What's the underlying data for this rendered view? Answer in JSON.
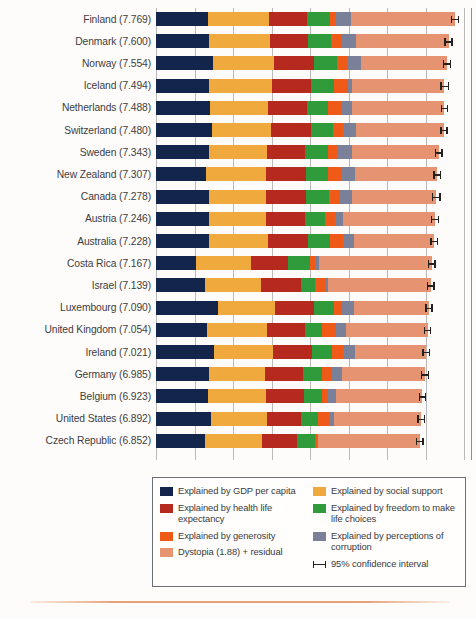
{
  "chart_data": {
    "type": "bar",
    "orientation": "horizontal",
    "stacked": true,
    "title": "",
    "xlabel": "",
    "ylabel": "",
    "xlim": [
      0,
      8
    ],
    "grid": true,
    "gridline_values": [
      0,
      1,
      2,
      3,
      4,
      5,
      6,
      7,
      8
    ],
    "legend_position": "bottom",
    "categories": [
      "Finland (7.769)",
      "Denmark (7.600)",
      "Norway (7.554)",
      "Iceland (7.494)",
      "Netherlands (7.488)",
      "Switzerland (7.480)",
      "Sweden (7.343)",
      "New Zealand (7.307)",
      "Canada (7.278)",
      "Austria (7.246)",
      "Australia (7.228)",
      "Costa Rica (7.167)",
      "Israel (7.139)",
      "Luxembourg (7.090)",
      "United Kingdom (7.054)",
      "Ireland (7.021)",
      "Germany (6.985)",
      "Belgium (6.923)",
      "United States (6.892)",
      "Czech Republic (6.852)"
    ],
    "series": [
      {
        "name": "Explained by GDP per capita",
        "key": "gdp",
        "color": "#14254c"
      },
      {
        "name": "Explained by social support",
        "key": "social",
        "color": "#f0a93c"
      },
      {
        "name": "Explained by health life expectancy",
        "key": "health",
        "color": "#b5291f"
      },
      {
        "name": "Explained by freedom to make life choices",
        "key": "freedom",
        "color": "#2f9b3a"
      },
      {
        "name": "Explained by generosity",
        "key": "generosity",
        "color": "#f05a19"
      },
      {
        "name": "Explained by perceptions of corruption",
        "key": "corruption",
        "color": "#7b8099"
      },
      {
        "name": "Dystopia (1.88) + residual",
        "key": "dystopia",
        "color": "#e59370"
      }
    ],
    "rows": [
      {
        "country": "Finland",
        "score": 7.769,
        "gdp": 1.34,
        "social": 1.587,
        "health": 0.986,
        "freedom": 0.596,
        "generosity": 0.153,
        "corruption": 0.393,
        "dystopia": 2.714,
        "ci_low": 7.66,
        "ci_high": 7.88
      },
      {
        "country": "Denmark",
        "score": 7.6,
        "gdp": 1.383,
        "social": 1.573,
        "health": 0.996,
        "freedom": 0.592,
        "generosity": 0.252,
        "corruption": 0.41,
        "dystopia": 2.394,
        "ci_low": 7.49,
        "ci_high": 7.71
      },
      {
        "country": "Norway",
        "score": 7.554,
        "gdp": 1.488,
        "social": 1.582,
        "health": 1.028,
        "freedom": 0.603,
        "generosity": 0.271,
        "corruption": 0.341,
        "dystopia": 2.241,
        "ci_low": 7.45,
        "ci_high": 7.66
      },
      {
        "country": "Iceland",
        "score": 7.494,
        "gdp": 1.38,
        "social": 1.624,
        "health": 1.026,
        "freedom": 0.591,
        "generosity": 0.354,
        "corruption": 0.118,
        "dystopia": 2.401,
        "ci_low": 7.38,
        "ci_high": 7.61
      },
      {
        "country": "Netherlands",
        "score": 7.488,
        "gdp": 1.396,
        "social": 1.522,
        "health": 0.999,
        "freedom": 0.557,
        "generosity": 0.322,
        "corruption": 0.298,
        "dystopia": 2.394,
        "ci_low": 7.39,
        "ci_high": 7.59
      },
      {
        "country": "Switzerland",
        "score": 7.48,
        "gdp": 1.452,
        "social": 1.526,
        "health": 1.052,
        "freedom": 0.572,
        "generosity": 0.263,
        "corruption": 0.343,
        "dystopia": 2.272,
        "ci_low": 7.38,
        "ci_high": 7.58
      },
      {
        "country": "Sweden",
        "score": 7.343,
        "gdp": 1.387,
        "social": 1.487,
        "health": 1.009,
        "freedom": 0.574,
        "generosity": 0.267,
        "corruption": 0.373,
        "dystopia": 2.246,
        "ci_low": 7.24,
        "ci_high": 7.45
      },
      {
        "country": "New Zealand",
        "score": 7.307,
        "gdp": 1.303,
        "social": 1.557,
        "health": 1.026,
        "freedom": 0.585,
        "generosity": 0.33,
        "corruption": 0.38,
        "dystopia": 2.126,
        "ci_low": 7.2,
        "ci_high": 7.41
      },
      {
        "country": "Canada",
        "score": 7.278,
        "gdp": 1.365,
        "social": 1.505,
        "health": 1.039,
        "freedom": 0.584,
        "generosity": 0.285,
        "corruption": 0.308,
        "dystopia": 2.192,
        "ci_low": 7.17,
        "ci_high": 7.39
      },
      {
        "country": "Austria",
        "score": 7.246,
        "gdp": 1.376,
        "social": 1.475,
        "health": 1.016,
        "freedom": 0.532,
        "generosity": 0.244,
        "corruption": 0.226,
        "dystopia": 2.377,
        "ci_low": 7.14,
        "ci_high": 7.35
      },
      {
        "country": "Australia",
        "score": 7.228,
        "gdp": 1.372,
        "social": 1.548,
        "health": 1.036,
        "freedom": 0.557,
        "generosity": 0.332,
        "corruption": 0.29,
        "dystopia": 2.093,
        "ci_low": 7.12,
        "ci_high": 7.33
      },
      {
        "country": "Costa Rica",
        "score": 7.167,
        "gdp": 1.034,
        "social": 1.441,
        "health": 0.963,
        "freedom": 0.558,
        "generosity": 0.144,
        "corruption": 0.093,
        "dystopia": 2.934,
        "ci_low": 7.06,
        "ci_high": 7.27
      },
      {
        "country": "Israel",
        "score": 7.139,
        "gdp": 1.276,
        "social": 1.455,
        "health": 1.029,
        "freedom": 0.371,
        "generosity": 0.261,
        "corruption": 0.082,
        "dystopia": 2.665,
        "ci_low": 7.04,
        "ci_high": 7.24
      },
      {
        "country": "Luxembourg",
        "score": 7.09,
        "gdp": 1.609,
        "social": 1.479,
        "health": 1.012,
        "freedom": 0.526,
        "generosity": 0.194,
        "corruption": 0.316,
        "dystopia": 1.954,
        "ci_low": 6.99,
        "ci_high": 7.19
      },
      {
        "country": "United Kingdom",
        "score": 7.054,
        "gdp": 1.333,
        "social": 1.538,
        "health": 0.996,
        "freedom": 0.45,
        "generosity": 0.348,
        "corruption": 0.278,
        "dystopia": 2.111,
        "ci_low": 6.96,
        "ci_high": 7.15
      },
      {
        "country": "Ireland",
        "score": 7.021,
        "gdp": 1.499,
        "social": 1.553,
        "health": 0.999,
        "freedom": 0.516,
        "generosity": 0.298,
        "corruption": 0.31,
        "dystopia": 1.846,
        "ci_low": 6.92,
        "ci_high": 7.12
      },
      {
        "country": "Germany",
        "score": 6.985,
        "gdp": 1.373,
        "social": 1.454,
        "health": 0.987,
        "freedom": 0.495,
        "generosity": 0.261,
        "corruption": 0.265,
        "dystopia": 2.15,
        "ci_low": 6.88,
        "ci_high": 7.09
      },
      {
        "country": "Belgium",
        "score": 6.923,
        "gdp": 1.356,
        "social": 1.504,
        "health": 0.986,
        "freedom": 0.473,
        "generosity": 0.16,
        "corruption": 0.21,
        "dystopia": 2.234,
        "ci_low": 6.83,
        "ci_high": 7.02
      },
      {
        "country": "United States",
        "score": 6.892,
        "gdp": 1.433,
        "social": 1.457,
        "health": 0.874,
        "freedom": 0.454,
        "generosity": 0.28,
        "corruption": 0.128,
        "dystopia": 2.266,
        "ci_low": 6.79,
        "ci_high": 6.99
      },
      {
        "country": "Czech Republic",
        "score": 6.852,
        "gdp": 1.269,
        "social": 1.487,
        "health": 0.92,
        "freedom": 0.457,
        "generosity": 0.046,
        "corruption": 0.036,
        "dystopia": 2.637,
        "ci_low": 6.75,
        "ci_high": 6.95
      }
    ]
  },
  "legend": {
    "left_column": [
      {
        "label": "Explained by GDP per capita",
        "color": "#14254c"
      },
      {
        "label": "Explained by health life expectancy",
        "color": "#b5291f"
      },
      {
        "label": "Explained by generosity",
        "color": "#f05a19"
      },
      {
        "label": "Dystopia (1.88) + residual",
        "color": "#e59370"
      }
    ],
    "right_column": [
      {
        "label": "Explained by social support",
        "color": "#f0a93c"
      },
      {
        "label": "Explained by freedom to make life choices",
        "color": "#2f9b3a"
      },
      {
        "label": "Explained by perceptions of corruption",
        "color": "#7b8099"
      },
      {
        "label": "95% confidence interval",
        "color": "#222222"
      }
    ]
  },
  "colors": {
    "gdp": "#14254c",
    "social": "#f0a93c",
    "health": "#b5291f",
    "freedom": "#2f9b3a",
    "generosity": "#f05a19",
    "corruption": "#7b8099",
    "dystopia": "#e59370",
    "ci": "#222222",
    "page_background": "#fdfcfb",
    "rule": "#e29262"
  }
}
